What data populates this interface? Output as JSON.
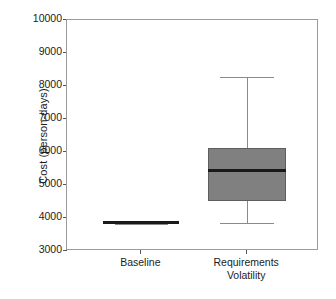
{
  "chart_data": {
    "type": "box",
    "title": "",
    "xlabel": "",
    "ylabel": "Cost (person-days)",
    "ylim": [
      3000,
      10000
    ],
    "ytick_labels": [
      "10000",
      "9000",
      "8000",
      "7000",
      "6000",
      "5000",
      "4000",
      "3000"
    ],
    "ytick_values": [
      10000,
      9000,
      8000,
      7000,
      6000,
      5000,
      4000,
      3000
    ],
    "grid": false,
    "legend": "none",
    "categories": [
      "Baseline",
      "Requirements\nVolatility"
    ],
    "boxes": [
      {
        "label": "Baseline",
        "whisker_low": 3830,
        "q1": 3835,
        "median": 3860,
        "q3": 3890,
        "whisker_high": 3895
      },
      {
        "label": "Requirements Volatility",
        "whisker_low": 3850,
        "q1": 4510,
        "median": 5450,
        "q3": 6120,
        "whisker_high": 8270
      }
    ],
    "colors": {
      "box_fill": "#808080",
      "box_edge": "#5e5e5e",
      "median": "#1a1a1a",
      "whisker": "#8a8a8a",
      "frame": "#9b9b9b",
      "background": "#ffffff",
      "text": "#1c1c1c"
    }
  },
  "axis": {
    "y_title": "Cost (person-days)",
    "ticks": [
      {
        "label": "10000"
      },
      {
        "label": "9000"
      },
      {
        "label": "8000"
      },
      {
        "label": "7000"
      },
      {
        "label": "6000"
      },
      {
        "label": "5000"
      },
      {
        "label": "4000"
      },
      {
        "label": "3000"
      }
    ]
  },
  "categories": [
    {
      "label": "Baseline"
    },
    {
      "label": "Requirements\nVolatility"
    }
  ]
}
